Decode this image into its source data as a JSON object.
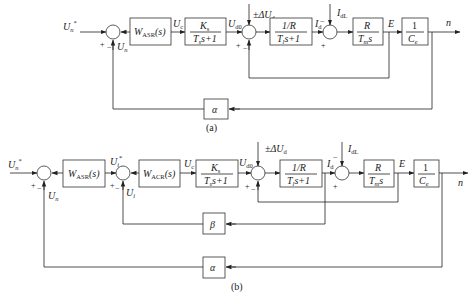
{
  "diagram_a": {
    "caption": "(a)",
    "input_label": "U",
    "input_sub": "n",
    "input_sup": "*",
    "feedback_label": "U",
    "feedback_sub": "n",
    "blocks": {
      "asr": {
        "name": "W",
        "sub": "ASR",
        "arg": "(s)"
      },
      "converter": {
        "num": "K",
        "num_sub": "s",
        "den": "T",
        "den_sub": "s",
        "den_tail": "s+1"
      },
      "armature": {
        "num": "1/R",
        "den": "T",
        "den_sub": "l",
        "den_tail": "s+1"
      },
      "mech": {
        "num": "R",
        "den": "T",
        "den_sub": "m",
        "den_tail": "s"
      },
      "emf": {
        "num": "1",
        "den": "C",
        "den_sub": "e"
      },
      "speed_fb": {
        "label": "α"
      }
    },
    "signals": {
      "uc": {
        "main": "U",
        "sub": "c"
      },
      "ud0": {
        "main": "U",
        "sub": "d0"
      },
      "disturb": {
        "prefix": "±ΔU",
        "sub": "d"
      },
      "id": {
        "main": "I",
        "sub": "d"
      },
      "idl": {
        "main": "I",
        "sub": "dL"
      },
      "e": "E",
      "n": "n"
    },
    "signs": {
      "plus": "+",
      "minus": "−"
    }
  },
  "diagram_b": {
    "caption": "(b)",
    "input_label": "U",
    "input_sub": "n",
    "input_sup": "*",
    "feedback_n_label": "U",
    "feedback_n_sub": "n",
    "ui_star_label": "U",
    "ui_star_sub": "i",
    "ui_star_sup": "*",
    "ui_label": "U",
    "ui_sub": "i",
    "blocks": {
      "asr": {
        "name": "W",
        "sub": "ASR",
        "arg": "(s)"
      },
      "acr": {
        "name": "W",
        "sub": "ACR",
        "arg": "(s)"
      },
      "converter": {
        "num": "K",
        "num_sub": "s",
        "den": "T",
        "den_sub": "s",
        "den_tail": "s+1"
      },
      "armature": {
        "num": "1/R",
        "den": "T",
        "den_sub": "l",
        "den_tail": "s+1"
      },
      "mech": {
        "num": "R",
        "den": "T",
        "den_sub": "m",
        "den_tail": "s"
      },
      "emf": {
        "num": "1",
        "den": "C",
        "den_sub": "e"
      },
      "current_fb": {
        "label": "β"
      },
      "speed_fb": {
        "label": "α"
      }
    },
    "signals": {
      "uc": {
        "main": "U",
        "sub": "c"
      },
      "ud0": {
        "main": "U",
        "sub": "d0"
      },
      "disturb": {
        "prefix": "±ΔU",
        "sub": "d"
      },
      "id": {
        "main": "I",
        "sub": "d"
      },
      "idl": {
        "main": "I",
        "sub": "dL"
      },
      "e": "E",
      "n": "n"
    },
    "signs": {
      "plus": "+",
      "minus": "−"
    }
  }
}
